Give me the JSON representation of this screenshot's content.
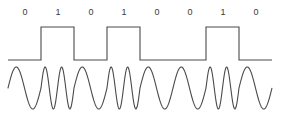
{
  "figure": {
    "background_color": "#ffffff",
    "stroke_color": "#4a4a4a",
    "label_color": "#3a3a3a",
    "width": 282,
    "height": 120
  },
  "bit_labels": {
    "name": "binary-data-labels",
    "values": [
      "0",
      "1",
      "0",
      "1",
      "0",
      "0",
      "1",
      "0"
    ],
    "y": 13,
    "x_centers": [
      25,
      58,
      91,
      124,
      157,
      190,
      223,
      256
    ]
  },
  "chart_data": {
    "type": "line",
    "subtitle": "Binary data, digital square wave, and frequency-shift-keyed carrier",
    "xlabel": "",
    "ylabel": "",
    "grid": false,
    "legend": "none",
    "categories": [
      "0",
      "1",
      "0",
      "1",
      "0",
      "0",
      "1",
      "0"
    ],
    "bit_count": 8,
    "bit_width_px": 33,
    "x_start_px": 8,
    "x_end_px": 272,
    "series": [
      {
        "name": "binary-data",
        "values": [
          0,
          1,
          0,
          1,
          0,
          0,
          1,
          0
        ]
      },
      {
        "name": "digital-square-wave",
        "high_level_px": 27,
        "low_level_px": 60,
        "values": [
          0,
          1,
          0,
          1,
          0,
          0,
          1,
          0
        ]
      },
      {
        "name": "fsk-carrier",
        "description": "Carrier frequency is higher for bit 1 and lower for bit 0",
        "center_px": 88,
        "amplitude_px": 21,
        "cycles_per_bit_for_zero": 1,
        "cycles_per_bit_for_one": 2,
        "values": [
          1,
          2,
          1,
          2,
          1,
          1,
          2,
          1
        ]
      }
    ],
    "ylim": [
      0,
      120
    ],
    "xlim": [
      0,
      282
    ]
  }
}
